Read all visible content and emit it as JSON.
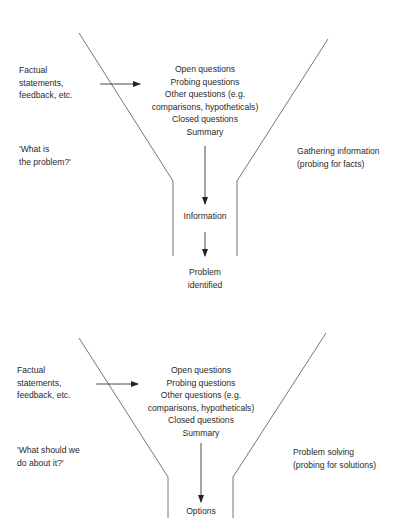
{
  "funnels": [
    {
      "id": "top",
      "input_label": [
        "Factual",
        "statements,",
        "feedback, etc."
      ],
      "question_prompt": [
        "'What is",
        "the problem?'"
      ],
      "stages": [
        "Open questions",
        "Probing questions",
        "Other questions (e.g.",
        "comparisons, hypotheticals)",
        "Closed questions",
        "Summary"
      ],
      "side_label": [
        "Gathering information",
        "(probing for facts)"
      ],
      "middle_output": "Information",
      "final_output": [
        "Problem",
        "identified"
      ]
    },
    {
      "id": "bottom",
      "input_label": [
        "Factual",
        "statements,",
        "feedback, etc."
      ],
      "question_prompt": [
        "'What should we",
        "do about it?'"
      ],
      "stages": [
        "Open questions",
        "Probing questions",
        "Other questions (e.g.",
        "comparisons, hypotheticals)",
        "Closed questions",
        "Summary"
      ],
      "side_label": [
        "Problem solving",
        "(probing for solutions)"
      ],
      "middle_output": "Options"
    }
  ],
  "colors": {
    "line": "#555555",
    "text": "#2a2a2a"
  }
}
